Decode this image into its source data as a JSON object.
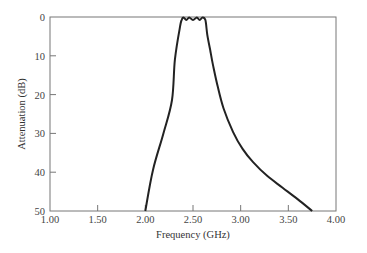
{
  "chart_data": {
    "type": "line",
    "title": "",
    "xlabel": "Frequency (GHz)",
    "ylabel": "Attenuation (dB)",
    "xlim": [
      1.0,
      4.0
    ],
    "ylim": [
      0,
      50
    ],
    "y_inverted": true,
    "grid": false,
    "legend": null,
    "x_ticks": [
      "1.00",
      "1.50",
      "2.00",
      "2.50",
      "3.00",
      "3.50",
      "4.00"
    ],
    "y_ticks": [
      "0",
      "10",
      "20",
      "30",
      "40",
      "50"
    ],
    "series": [
      {
        "name": "Bandpass filter response",
        "color": "#222222",
        "x": [
          2.0,
          2.08,
          2.19,
          2.28,
          2.31,
          2.36,
          2.38,
          2.4,
          2.43,
          2.46,
          2.5,
          2.54,
          2.57,
          2.6,
          2.63,
          2.65,
          2.68,
          2.71,
          2.76,
          2.82,
          2.92,
          3.02,
          3.13,
          3.28,
          3.44,
          3.6,
          3.75
        ],
        "y": [
          50,
          39.4,
          30,
          21.4,
          11,
          3,
          0.8,
          0.1,
          0.8,
          0.1,
          0.8,
          0.1,
          0.8,
          0.1,
          0.8,
          4.6,
          8.5,
          12.4,
          18,
          23.5,
          29.6,
          34,
          37.4,
          41,
          44,
          47,
          50
        ]
      }
    ]
  }
}
